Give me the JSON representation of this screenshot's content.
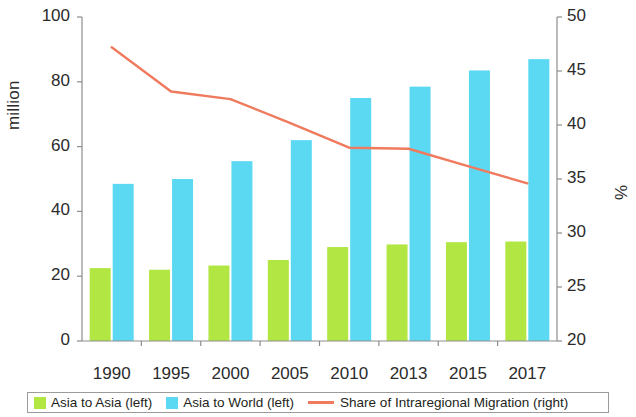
{
  "chart_data": {
    "type": "bar",
    "title": "",
    "categories": [
      "1990",
      "1995",
      "2000",
      "2005",
      "2010",
      "2013",
      "2015",
      "2017"
    ],
    "series": [
      {
        "name": "Asia to Asia (left)",
        "type": "bar",
        "axis": "left",
        "color": "#b2e642",
        "values": [
          22.5,
          22,
          23.3,
          25,
          29,
          29.8,
          30.5,
          30.7
        ]
      },
      {
        "name": "Asia to World (left)",
        "type": "bar",
        "axis": "left",
        "color": "#5cd9f2",
        "values": [
          48.5,
          50,
          55.5,
          62,
          75,
          78.5,
          83.5,
          87
        ]
      },
      {
        "name": "Share of Intraregional Migration (right)",
        "type": "line",
        "axis": "right",
        "color": "#ef7a5e",
        "values": [
          47.2,
          43.1,
          42.4,
          40.2,
          37.9,
          37.8,
          36.2,
          34.6
        ]
      }
    ],
    "left_axis": {
      "label": "million",
      "ticks": [
        "0",
        "20",
        "40",
        "60",
        "80",
        "100"
      ],
      "ylim": [
        0,
        100
      ]
    },
    "right_axis": {
      "label": "%",
      "ticks": [
        "20",
        "25",
        "30",
        "35",
        "40",
        "45",
        "50"
      ],
      "ylim": [
        20,
        50
      ]
    },
    "xlabel": "",
    "grid": false,
    "legend_position": "bottom"
  },
  "legend": {
    "items": [
      {
        "label": "Asia to Asia (left)",
        "marker": "square-swatch",
        "color": "#b2e642"
      },
      {
        "label": "Asia to World (left)",
        "marker": "square-swatch",
        "color": "#5cd9f2"
      },
      {
        "label": "Share of Intraregional Migration (right)",
        "marker": "line-swatch",
        "color": "#ef7a5e"
      }
    ]
  }
}
